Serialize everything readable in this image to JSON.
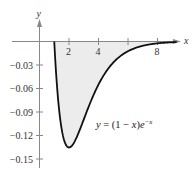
{
  "chart_data": {
    "type": "area",
    "title": "",
    "function_label": "y = (1 − x)e^(−x)",
    "xlabel": "x",
    "ylabel": "y",
    "xlim": [
      -0.6,
      9.5
    ],
    "ylim": [
      -0.162,
      0.05
    ],
    "x_ticks": [
      2,
      4,
      6,
      8
    ],
    "x_tick_labels": [
      "2",
      "4",
      "",
      "8"
    ],
    "y_ticks": [
      -0.03,
      -0.06,
      -0.09,
      -0.12,
      -0.15
    ],
    "y_tick_labels": [
      "−0.03",
      "−0.06",
      "−0.09",
      "−0.12",
      "−0.15"
    ],
    "grid": false,
    "legend": "none",
    "shaded_region": {
      "from_x": 1,
      "to_x": 9.3,
      "between": "curve and x-axis",
      "fill": "#ececec"
    },
    "series": [
      {
        "name": "y = (1 − x)e^(−x)",
        "x": [
          1,
          1.25,
          1.5,
          1.75,
          2,
          2.5,
          3,
          3.5,
          4,
          4.5,
          5,
          5.5,
          6,
          6.5,
          7,
          7.5,
          8,
          8.5,
          9,
          9.3
        ],
        "values": [
          0,
          -0.0716,
          -0.1116,
          -0.1303,
          -0.1353,
          -0.1231,
          -0.0996,
          -0.0755,
          -0.0549,
          -0.0389,
          -0.027,
          -0.0184,
          -0.0124,
          -0.0083,
          -0.0055,
          -0.0036,
          -0.0023,
          -0.0015,
          -0.001,
          -0.0008
        ],
        "color": "#111111"
      }
    ]
  },
  "labels": {
    "x_axis": "x",
    "y_axis": "y",
    "x_tick_2": "2",
    "x_tick_4": "4",
    "x_tick_8": "8",
    "y_tick_003": "−0.03",
    "y_tick_006": "−0.06",
    "y_tick_009": "−0.09",
    "y_tick_012": "−0.12",
    "y_tick_015": "−0.15",
    "equation_prefix": "y",
    "equation_mid": " = (1 − ",
    "equation_x": "x",
    "equation_close": ")",
    "equation_e": "e",
    "equation_exp": "−x"
  },
  "colors": {
    "curve": "#111111",
    "axis": "#888888",
    "fill": "#ececec",
    "text": "#333333"
  }
}
